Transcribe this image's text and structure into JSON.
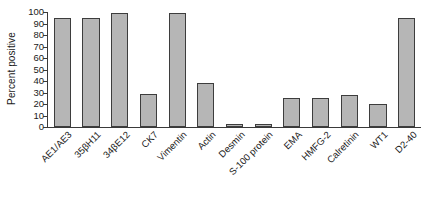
{
  "chart_data": {
    "type": "bar",
    "title": "",
    "xlabel": "",
    "ylabel": "Percent positive",
    "ylim": [
      0,
      100
    ],
    "yticks": [
      0,
      10,
      20,
      30,
      40,
      50,
      60,
      70,
      80,
      90,
      100
    ],
    "ytick_labels": [
      "0",
      "10",
      "20",
      "30",
      "40",
      "50",
      "60",
      "70",
      "80",
      "90",
      "100"
    ],
    "grid": false,
    "legend": null,
    "bar_color": "#b6b6b6",
    "bar_edge_color": "#3d3d3d",
    "axis_color": "#3a3a3a",
    "categories": [
      "AE1/AE3",
      "35βH11",
      "34βE12",
      "CK7",
      "Vimentin",
      "Actin",
      "Desmin",
      "S-100 protein",
      "EMA",
      "HMFG-2",
      "Calretinin",
      "WT1",
      "D2-40"
    ],
    "values": [
      95,
      95,
      99,
      29,
      99,
      38,
      3,
      3,
      25,
      25,
      28,
      20,
      95
    ]
  }
}
